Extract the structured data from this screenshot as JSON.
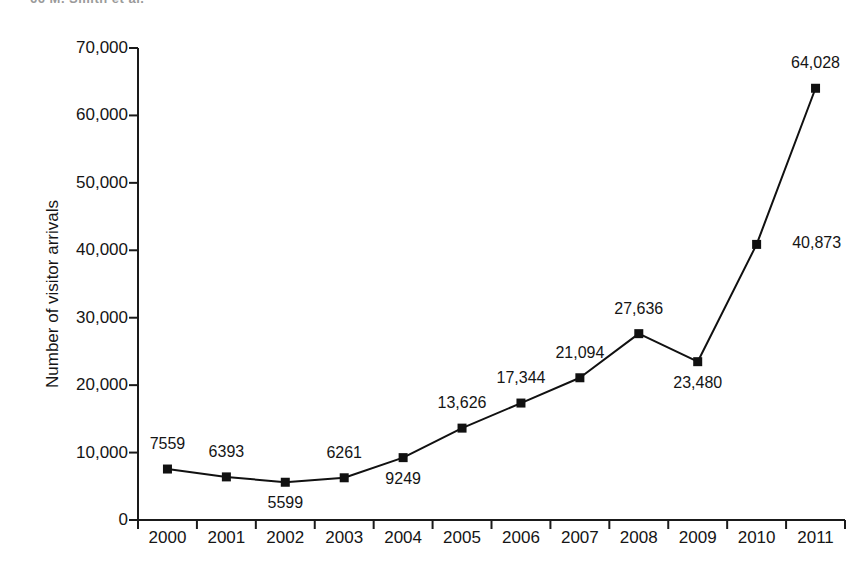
{
  "page": {
    "running_header": "66  M. Smith et al."
  },
  "chart_data": {
    "type": "line",
    "title": "",
    "xlabel": "",
    "ylabel": "Number of visitor arrivals",
    "categories": [
      "2000",
      "2001",
      "2002",
      "2003",
      "2004",
      "2005",
      "2006",
      "2007",
      "2008",
      "2009",
      "2010",
      "2011"
    ],
    "values": [
      7559,
      6393,
      5599,
      6261,
      9249,
      13626,
      17344,
      21094,
      27636,
      23480,
      40873,
      64028
    ],
    "point_labels": [
      "7559",
      "6393",
      "5599",
      "6261",
      "9249",
      "13,626",
      "17,344",
      "21,094",
      "27,636",
      "23,480",
      "40,873",
      "64,028"
    ],
    "label_positions": [
      "above",
      "above",
      "below",
      "above",
      "below",
      "above",
      "above",
      "above",
      "above",
      "below",
      "right",
      "above"
    ],
    "ylim": [
      0,
      70000
    ],
    "ytick_values": [
      0,
      10000,
      20000,
      30000,
      40000,
      50000,
      60000,
      70000
    ],
    "ytick_labels": [
      "0",
      "10,000",
      "20,000",
      "30,000",
      "40,000",
      "50,000",
      "60,000",
      "70,000"
    ],
    "grid": false,
    "legend": false,
    "marker": "square",
    "series_color": "#111111",
    "line_width": 2
  }
}
